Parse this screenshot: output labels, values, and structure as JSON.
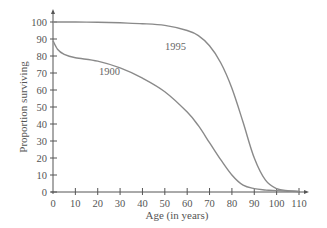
{
  "chart_data": {
    "type": "line",
    "title": "",
    "xlabel": "Age (in years)",
    "ylabel": "Proportion surviving",
    "xlim": [
      0,
      110
    ],
    "ylim": [
      0,
      100
    ],
    "x_ticks": [
      0,
      10,
      20,
      30,
      40,
      50,
      60,
      70,
      80,
      90,
      100,
      110
    ],
    "y_ticks": [
      0,
      10,
      20,
      30,
      40,
      50,
      60,
      70,
      80,
      90,
      100
    ],
    "grid": false,
    "legend": "inline labels",
    "series": [
      {
        "name": "1900",
        "color": "#8a8a8a",
        "x": [
          0,
          2,
          5,
          10,
          20,
          30,
          40,
          50,
          60,
          65,
          70,
          75,
          80,
          85,
          90,
          95,
          100,
          105,
          110
        ],
        "values": [
          89,
          84,
          81,
          79,
          77,
          73,
          67,
          59,
          47,
          39,
          29,
          19,
          10,
          4,
          2,
          1.2,
          0.8,
          0.5,
          0.3
        ],
        "label_pos": {
          "x": 33,
          "y": 70
        }
      },
      {
        "name": "1995",
        "color": "#8a8a8a",
        "x": [
          0,
          10,
          20,
          30,
          40,
          50,
          60,
          65,
          70,
          75,
          80,
          85,
          90,
          95,
          100,
          105,
          110
        ],
        "values": [
          100,
          100,
          99.8,
          99.5,
          99,
          98,
          95,
          92,
          86,
          76,
          61,
          41,
          20,
          7,
          2,
          0.8,
          0.3
        ],
        "label_pos": {
          "x": 63,
          "y": 86
        }
      }
    ]
  },
  "labels": {
    "xlabel": "Age (in years)",
    "ylabel": "Proportion surviving",
    "series_1900": "1900",
    "series_1995": "1995"
  }
}
